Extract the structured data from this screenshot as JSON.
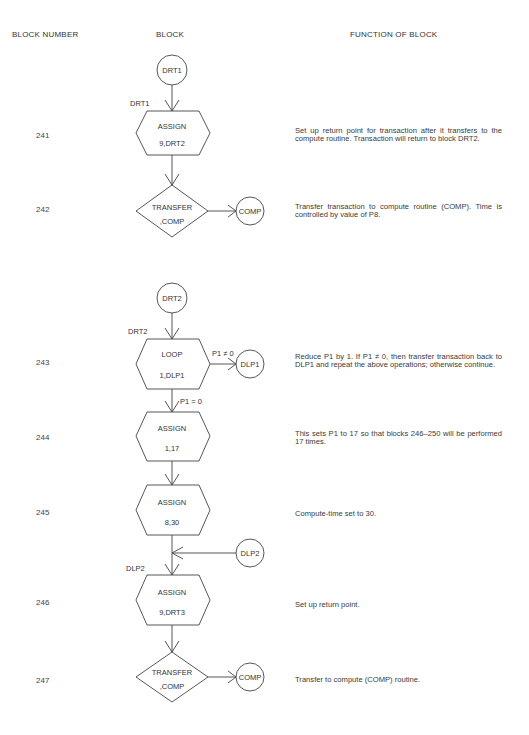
{
  "headers": {
    "block_number": "BLOCK NUMBER",
    "block": "BLOCK",
    "function": "FUNCTION OF BLOCK"
  },
  "rows": [
    {
      "number": "241",
      "description": "Set up return point for transaction after it transfers to the compute routine. Transaction will return to block DRT2."
    },
    {
      "number": "242",
      "description": "Transfer transaction to compute routine (COMP). Time is controlled by value of P8."
    },
    {
      "number": "243",
      "description": "Reduce P1 by 1. If P1 ≠ 0, then transfer transaction back to DLP1 and repeat the above operations; otherwise continue."
    },
    {
      "number": "244",
      "description": "This sets P1 to 17 so that blocks 246–250 will be performed 17 times."
    },
    {
      "number": "245",
      "description": "Compute-time set to 30."
    },
    {
      "number": "246",
      "description": "Set up return point."
    },
    {
      "number": "247",
      "description": "Transfer to compute (COMP) routine."
    }
  ],
  "diagram": {
    "nodes": {
      "drt1_circle": "DRT1",
      "drt1_label": "DRT1",
      "assign1_line1": "ASSIGN",
      "assign1_line2": "9,DRT2",
      "transfer1_line1": "TRANSFER",
      "transfer1_line2": ",COMP",
      "comp1_circle": "COMP",
      "drt2_circle": "DRT2",
      "drt2_label": "DRT2",
      "loop_line1": "LOOP",
      "loop_line2": "1,DLP1",
      "loop_cond_ne": "P1 ≠ 0",
      "dlp1_circle": "DLP1",
      "loop_cond_eq": "P1 = 0",
      "assign2_line1": "ASSIGN",
      "assign2_line2": "1,17",
      "assign3_line1": "ASSIGN",
      "assign3_line2": "8,30",
      "dlp2_circle": "DLP2",
      "dlp2_label": "DLP2",
      "assign4_line1": "ASSIGN",
      "assign4_line2": "9,DRT3",
      "transfer2_line1": "TRANSFER",
      "transfer2_line2": ",COMP",
      "comp2_circle": "COMP"
    }
  }
}
